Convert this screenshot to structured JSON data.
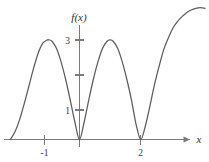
{
  "chart_data": {
    "type": "line",
    "title": "",
    "subtitle": "",
    "xlabel": "x",
    "ylabel": "f(x)",
    "xlim": [
      -1.65,
      4.1
    ],
    "ylim": [
      -0.35,
      3.95
    ],
    "grid": false,
    "legend": null,
    "annotations": [],
    "x_ticks": [
      {
        "value": -1,
        "label": "-1"
      },
      {
        "value": 2,
        "label": "2"
      }
    ],
    "y_ticks": [
      {
        "value": 1,
        "label": "1"
      },
      {
        "value": 2,
        "label": ""
      },
      {
        "value": 3,
        "label": "3"
      }
    ],
    "series": [
      {
        "name": "f(x)",
        "description": "Smooth oscillating curve with zeros at x=0 and x=2 and local maxima of height 3 near x=-1 and x=1",
        "zeros": [
          0,
          2
        ],
        "maxima": [
          {
            "x": -1,
            "y": 3
          },
          {
            "x": 1,
            "y": 3
          }
        ],
        "minima": [
          {
            "x": 0,
            "y": 0
          },
          {
            "x": 2,
            "y": 0
          }
        ],
        "x": [
          -2.26,
          -2.1,
          -1.95,
          -1.8,
          -1.65,
          -1.5,
          -1.35,
          -1.2,
          -1.05,
          -1.0,
          -0.9,
          -0.75,
          -0.6,
          -0.45,
          -0.3,
          -0.15,
          0.0,
          0.15,
          0.3,
          0.45,
          0.6,
          0.75,
          0.9,
          1.0,
          1.1,
          1.25,
          1.4,
          1.55,
          1.7,
          1.85,
          2.0,
          2.15,
          2.3,
          2.45,
          2.6,
          2.75,
          2.9,
          3.05,
          3.2,
          3.35,
          3.5,
          3.65,
          3.8,
          3.95,
          4.1
        ],
        "y": [
          0.0,
          0.25,
          0.62,
          1.1,
          1.62,
          2.15,
          2.6,
          2.9,
          3.0,
          3.0,
          2.96,
          2.74,
          2.33,
          1.8,
          1.18,
          0.52,
          0.0,
          0.52,
          1.18,
          1.8,
          2.33,
          2.74,
          2.96,
          3.0,
          2.96,
          2.74,
          2.33,
          1.8,
          1.18,
          0.45,
          0.0,
          0.4,
          1.0,
          1.65,
          2.2,
          2.7,
          3.05,
          3.35,
          3.55,
          3.7,
          3.82,
          3.9,
          3.95,
          3.97,
          3.95
        ]
      }
    ]
  },
  "axis": {
    "x_axis_label": "x",
    "y_axis_label": "f(x)",
    "arrow": "right-arrow"
  },
  "colors": {
    "curve": "#5c5c5c",
    "axis": "#7a7a7a",
    "text": "#2e2e2e",
    "background": "#ffffff"
  }
}
